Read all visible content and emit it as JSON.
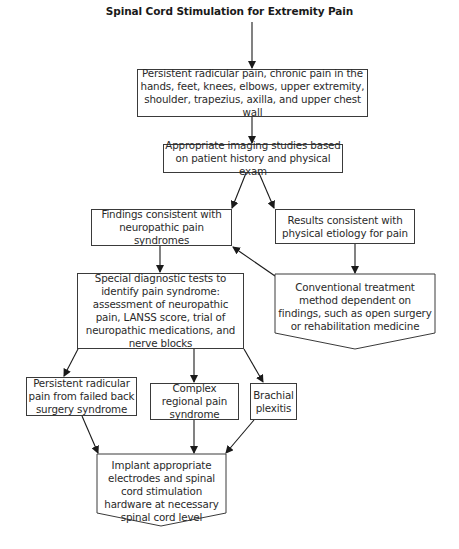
{
  "title": "Spinal Cord Stimulation for Extremity Pain",
  "nodes": {
    "presenting": "Persistent radicular pain, chronic pain in the hands, feet, knees, elbows, upper extremity, shoulder, trapezius, axilla, and upper chest wall",
    "imaging": "Appropriate imaging studies based on patient history and physical exam",
    "neuropathic": "Findings consistent with neuropathic pain syndromes",
    "physical": "Results consistent with physical etiology for pain",
    "conventional": "Conventional treatment method dependent on findings, such as open surgery or rehabilitation medicine",
    "diagnostic": "Special diagnostic tests to identify pain syndrome: assessment of neuropathic pain, LANSS score, trial of neuropathic medications, and nerve blocks",
    "fbss": "Persistent radicular pain from failed back surgery syndrome",
    "crps": "Complex regional pain syndrome",
    "brachial": "Brachial plexitis",
    "implant": "Implant appropriate electrodes and spinal cord stimulation hardware at necessary spinal cord level"
  },
  "edges": [
    {
      "from": "title",
      "to": "presenting"
    },
    {
      "from": "presenting",
      "to": "imaging"
    },
    {
      "from": "imaging",
      "to": "neuropathic"
    },
    {
      "from": "imaging",
      "to": "physical"
    },
    {
      "from": "physical",
      "to": "conventional"
    },
    {
      "from": "conventional",
      "to": "neuropathic"
    },
    {
      "from": "neuropathic",
      "to": "diagnostic"
    },
    {
      "from": "diagnostic",
      "to": "fbss"
    },
    {
      "from": "diagnostic",
      "to": "crps"
    },
    {
      "from": "diagnostic",
      "to": "brachial"
    },
    {
      "from": "fbss",
      "to": "implant"
    },
    {
      "from": "crps",
      "to": "implant"
    },
    {
      "from": "brachial",
      "to": "implant"
    }
  ],
  "colors": {
    "line": "#1a1a1a",
    "border": "#3a3a3a",
    "text": "#2a2a2a"
  }
}
